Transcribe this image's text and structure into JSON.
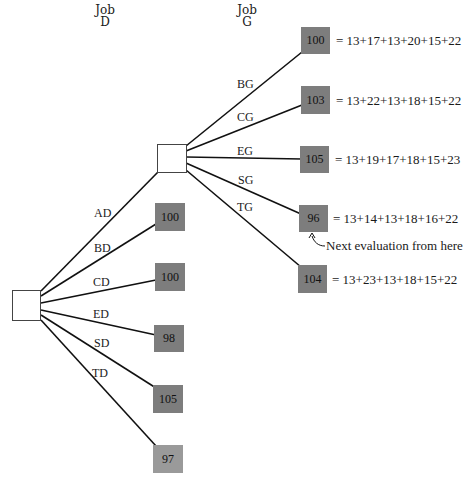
{
  "headers": {
    "job_d": {
      "line1": "Job",
      "line2": "D"
    },
    "job_g": {
      "line1": "Job",
      "line2": "G"
    }
  },
  "root_node": {
    "label": ""
  },
  "branch_node": {
    "label": ""
  },
  "d_branches": [
    {
      "edge": "AD",
      "value": null
    },
    {
      "edge": "BD",
      "value": "100"
    },
    {
      "edge": "CD",
      "value": "100"
    },
    {
      "edge": "ED",
      "value": "98"
    },
    {
      "edge": "SD",
      "value": "105"
    },
    {
      "edge": "TD",
      "value": "97"
    }
  ],
  "g_branches": [
    {
      "edge": "BG",
      "value": "100",
      "equation": "= 13+17+13+20+15+22"
    },
    {
      "edge": "CG",
      "value": "103",
      "equation": "= 13+22+13+18+15+22"
    },
    {
      "edge": "EG",
      "value": "105",
      "equation": "= 13+19+17+18+15+23"
    },
    {
      "edge": "SG",
      "value": "96",
      "equation": "= 13+14+13+18+16+22"
    },
    {
      "edge": "TG",
      "value": "104",
      "equation": "= 13+23+13+18+15+22"
    }
  ],
  "annotation": "Next evaluation from here",
  "colors": {
    "leaf": "#7d7d7d",
    "leaf_light": "#9a9a9a",
    "line": "#111111"
  }
}
